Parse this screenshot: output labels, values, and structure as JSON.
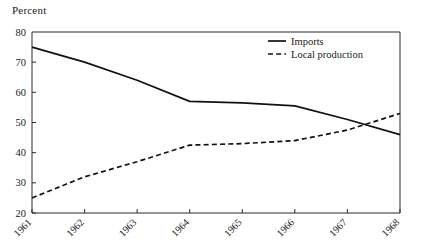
{
  "chart_data": {
    "type": "line",
    "title": "",
    "ylabel": "Percent",
    "xlabel": "",
    "categories": [
      "1961",
      "1962",
      "1963",
      "1964",
      "1965",
      "1966",
      "1967",
      "1968"
    ],
    "x": [
      1961,
      1962,
      1963,
      1964,
      1965,
      1966,
      1967,
      1968
    ],
    "series": [
      {
        "name": "Imports",
        "style": "solid",
        "color": "#111111",
        "values": [
          75,
          70,
          64,
          57,
          56.5,
          55.5,
          51,
          46
        ]
      },
      {
        "name": "Local production",
        "style": "dashed",
        "color": "#111111",
        "values": [
          25,
          32,
          37,
          42.5,
          43,
          44,
          47.5,
          53
        ]
      }
    ],
    "ylim": [
      20,
      80
    ],
    "yticks": [
      20,
      30,
      40,
      50,
      60,
      70,
      80
    ],
    "ytick_labels": [
      "20",
      "30",
      "40",
      "50",
      "60",
      "70",
      "80"
    ],
    "xtick_labels": [
      "1961",
      "1962",
      "1963",
      "1964",
      "1965",
      "1966",
      "1967",
      "1968"
    ],
    "xtick_rotation": -45,
    "grid": false,
    "legend_position": "top-right",
    "legend_entries": [
      "Imports",
      "Local production"
    ]
  }
}
